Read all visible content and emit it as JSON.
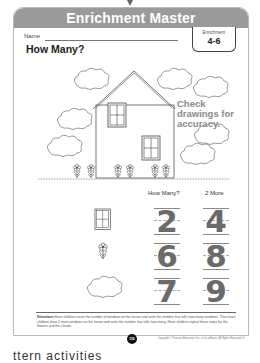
{
  "header": {
    "banner_title": "Enrichment Master",
    "badge_label": "Enrichment",
    "badge_number": "4-6"
  },
  "worksheet": {
    "name_label": "Name",
    "title": "How Many?",
    "answer_note": [
      "Check",
      "drawings for",
      "accuracy."
    ],
    "columns": [
      "How Many?",
      "2 More"
    ],
    "rows": [
      {
        "item_icon": "window-icon",
        "how_many": "2",
        "two_more": "4"
      },
      {
        "item_icon": "flower-icon",
        "how_many": "6",
        "two_more": "8"
      },
      {
        "item_icon": "cloud-icon",
        "how_many": "7",
        "two_more": "9"
      }
    ],
    "directions_label": "Directions",
    "directions_text": "Have children count the number of windows on the house and write the number that tells how many windows. Then have children draw 2 more windows on the house and write the number that tells how many. Have children repeat these steps for the flowers and the clouds.",
    "page_number": "116",
    "copyright": "Copyright © Pearson Education, Inc., or its affiliates. All Rights Reserved. K"
  },
  "caption": "ttern activities"
}
